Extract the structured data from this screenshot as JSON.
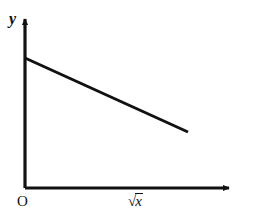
{
  "figure": {
    "background_color": "#ffffff",
    "ink_color": "#111111",
    "width": 276,
    "height": 217
  },
  "labels": {
    "y_axis": "y",
    "x_axis": "√x",
    "x_axis_radical_sign": "√",
    "x_axis_radicand": "x",
    "origin": "O"
  },
  "chart_data": {
    "type": "line",
    "title": "",
    "xlabel": "√x",
    "ylabel": "y",
    "grid": false,
    "legend": null,
    "annotations": [
      "O"
    ],
    "axes": {
      "x_axis": {
        "origin_px": [
          25,
          188
        ],
        "end_px": [
          235,
          188
        ],
        "arrow": true,
        "ticks": [],
        "tick_labels": [],
        "range_labeled": false
      },
      "y_axis": {
        "origin_px": [
          25,
          188
        ],
        "end_px": [
          25,
          13
        ],
        "arrow": true,
        "ticks": [],
        "tick_labels": [],
        "range_labeled": false
      }
    },
    "series": [
      {
        "name": "y vs √x",
        "style": "solid",
        "color": "#111111",
        "width_px": 3,
        "shape": "straight-line",
        "slope_sign": "negative",
        "intercept_on_y_axis": true,
        "points_px": [
          [
            25,
            58
          ],
          [
            188,
            132
          ]
        ],
        "x": [
          0,
          1
        ],
        "values": [
          1,
          0.548
        ]
      }
    ]
  }
}
